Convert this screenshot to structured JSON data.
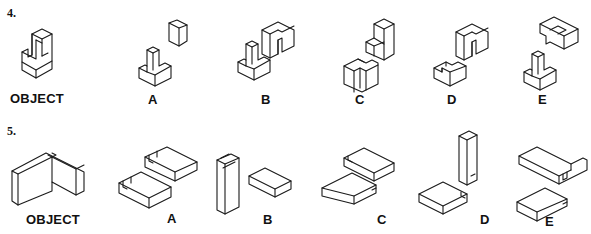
{
  "problems": [
    {
      "number": "4.",
      "object_label": "OBJECT",
      "options": [
        {
          "letter": "A",
          "description": "T-shaped base with separate small cube"
        },
        {
          "letter": "B",
          "description": "T-shaped base with separate notched block"
        },
        {
          "letter": "C",
          "description": "Stepped block with separate notched block"
        },
        {
          "letter": "D",
          "description": "Notched block pair"
        },
        {
          "letter": "E",
          "description": "T-shaped base with separate T-slot block"
        }
      ]
    },
    {
      "number": "5.",
      "object_label": "OBJECT",
      "options": [
        {
          "letter": "A",
          "description": "Two slotted flat blocks"
        },
        {
          "letter": "B",
          "description": "Tall grooved slab with flat block"
        },
        {
          "letter": "C",
          "description": "Two flat blocks with lip"
        },
        {
          "letter": "D",
          "description": "Tall block with flat block"
        },
        {
          "letter": "E",
          "description": "Slotted block with flat lipped block"
        }
      ]
    }
  ]
}
